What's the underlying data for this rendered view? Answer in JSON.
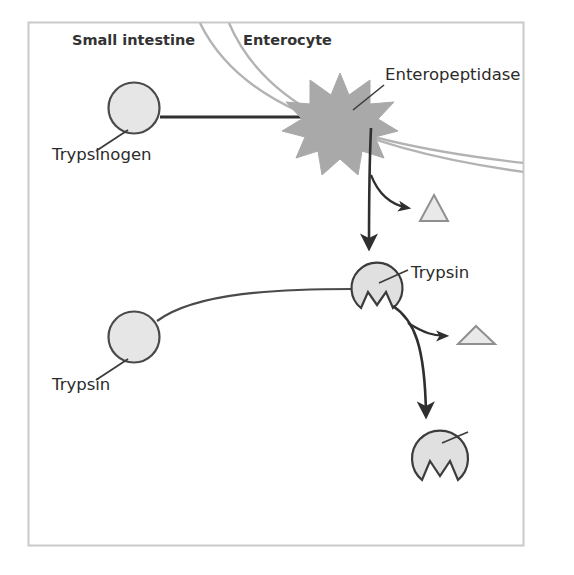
{
  "figure": {
    "title_visible": false,
    "background_color": "#ffffff",
    "frame": {
      "name": "figure-border",
      "x": 28,
      "y": 22,
      "width": 496,
      "height": 524,
      "stroke": "#c8c8c8",
      "fill": "#ffffff"
    }
  },
  "regions": [
    {
      "id": "small-intestine",
      "label": "Small intestine",
      "x": 72,
      "y": 45
    },
    {
      "id": "enterocyte",
      "label": "Enterocyte",
      "x": 243,
      "y": 45
    }
  ],
  "membrane": {
    "name": "cell-membrane",
    "stroke": "#b0b0b0",
    "line_count": 2,
    "description": "two parallel curved lines separating small intestine lumen from enterocyte"
  },
  "entities": [
    {
      "id": "trypsinogen-top",
      "label": "Trypsinogen",
      "shape": "circle",
      "cx": 134,
      "cy": 108,
      "r": 25,
      "fill": "#e6e6e6",
      "stroke": "#4a4a4a",
      "label_x": 52,
      "label_y": 160
    },
    {
      "id": "enteropeptidase",
      "label": "Enteropeptidase",
      "shape": "star",
      "cx": 340,
      "cy": 117,
      "outer_r": 44,
      "inner_r": 24,
      "points": 11,
      "fill": "#a9a9a9",
      "stroke": "#a9a9a9",
      "label_x": 383,
      "label_y": 80
    },
    {
      "id": "propeptide-1",
      "label": "",
      "shape": "triangle",
      "cx": 434,
      "cy": 208,
      "width": 28,
      "height": 26,
      "fill": "#e6e6e6",
      "stroke": "#8c8c8c"
    },
    {
      "id": "trypsin-middle",
      "label": "Trypsin",
      "shape": "notched-circle",
      "cx": 377,
      "cy": 288,
      "r": 25,
      "fill": "#e0e0e0",
      "stroke": "#3c3c3c",
      "label_x": 412,
      "label_y": 278
    },
    {
      "id": "propeptide-2",
      "label": "",
      "shape": "flat-triangle",
      "cx": 476,
      "cy": 335,
      "width": 36,
      "height": 17,
      "fill": "#e6e6e6",
      "stroke": "#8c8c8c"
    },
    {
      "id": "trypsinogen-bottom",
      "label": "Trypsinogen",
      "shape": "circle",
      "cx": 134,
      "cy": 337,
      "r": 25,
      "fill": "#e6e6e6",
      "stroke": "#4a4a4a",
      "label_x": 52,
      "label_y": 390
    },
    {
      "id": "trypsin-bottom",
      "label": "Trypsin",
      "shape": "notched-circle",
      "cx": 440,
      "cy": 458,
      "r": 28,
      "fill": "#e0e0e0",
      "stroke": "#3c3c3c",
      "label_x": 470,
      "label_y": 438
    }
  ],
  "connectors": [
    {
      "id": "trypsinogen-to-enteropeptidase",
      "type": "line",
      "arrow": false,
      "stroke": "#2f2f2f",
      "from": "trypsinogen-top",
      "to": "enteropeptidase"
    },
    {
      "id": "enteropeptidase-to-trypsin",
      "type": "arrow",
      "arrow": true,
      "stroke": "#2f2f2f",
      "from": "enteropeptidase",
      "to": "trypsin-middle"
    },
    {
      "id": "cleavage-branch-1",
      "type": "arrow",
      "arrow": true,
      "stroke": "#2f2f2f",
      "from": "enteropeptidase-to-trypsin",
      "to": "propeptide-1"
    },
    {
      "id": "trypsinogen-bottom-to-trypsin",
      "type": "line",
      "arrow": false,
      "stroke": "#4a4a4a",
      "from": "trypsinogen-bottom",
      "to": "trypsin-middle"
    },
    {
      "id": "trypsin-to-trypsin-bottom",
      "type": "arrow",
      "arrow": true,
      "stroke": "#2f2f2f",
      "from": "trypsin-middle",
      "to": "trypsin-bottom"
    },
    {
      "id": "cleavage-branch-2",
      "type": "arrow",
      "arrow": true,
      "stroke": "#2f2f2f",
      "from": "trypsin-to-trypsin-bottom",
      "to": "propeptide-2"
    }
  ],
  "leaders": [
    {
      "id": "leader-trypsinogen-top",
      "from": "trypsinogen-top",
      "stroke": "#3c3c3c"
    },
    {
      "id": "leader-enteropeptidase",
      "from": "enteropeptidase",
      "stroke": "#3c3c3c"
    },
    {
      "id": "leader-trypsin-middle",
      "from": "trypsin-middle",
      "stroke": "#3c3c3c"
    },
    {
      "id": "leader-trypsinogen-bottom",
      "from": "trypsinogen-bottom",
      "stroke": "#3c3c3c"
    },
    {
      "id": "leader-trypsin-bottom",
      "from": "trypsin-bottom",
      "stroke": "#3c3c3c"
    }
  ]
}
